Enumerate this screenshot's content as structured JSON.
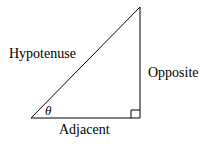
{
  "diagram": {
    "type": "right-triangle",
    "labels": {
      "hypotenuse": "Hypotenuse",
      "opposite": "Opposite",
      "adjacent": "Adjacent",
      "angle": "θ"
    },
    "colors": {
      "stroke": "#000000",
      "background": "#ffffff"
    }
  }
}
